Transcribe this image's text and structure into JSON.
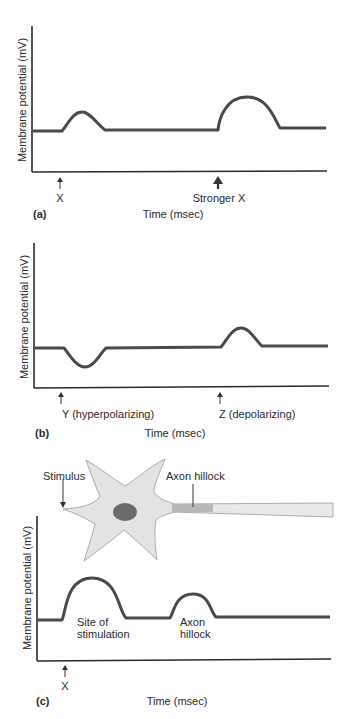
{
  "panels": [
    {
      "id": "a",
      "panel_label": "(a)",
      "ylabel": "Membrane potential (mV)",
      "xlabel": "Time (msec)",
      "stimuli": [
        {
          "label": "X",
          "strength": "weak"
        },
        {
          "label": "Stronger X",
          "strength": "strong"
        }
      ]
    },
    {
      "id": "b",
      "panel_label": "(b)",
      "ylabel": "Membrane potential (mV)",
      "xlabel": "Time (msec)",
      "stimuli": [
        {
          "label": "Y (hyperpolarizing)"
        },
        {
          "label": "Z (depolarizing)"
        }
      ]
    },
    {
      "id": "c",
      "panel_label": "(c)",
      "ylabel": "Membrane potential (mV)",
      "xlabel": "Time (msec)",
      "stimuli": [
        {
          "label": "X"
        }
      ],
      "neuron": {
        "stimulus_label": "Stimulus",
        "hillock_label": "Axon hillock"
      },
      "trace_labels": [
        {
          "line1": "Site of",
          "line2": "stimulation"
        },
        {
          "line1": "Axon",
          "line2": "hillock"
        }
      ]
    }
  ],
  "colors": {
    "trace": "#4a4a4a",
    "axis": "#2a2a2a",
    "neuron_body": "#e3e3e3",
    "nucleus": "#6b6b6b",
    "hillock": "#b8b8b8",
    "axon": "#e8e8e8"
  }
}
